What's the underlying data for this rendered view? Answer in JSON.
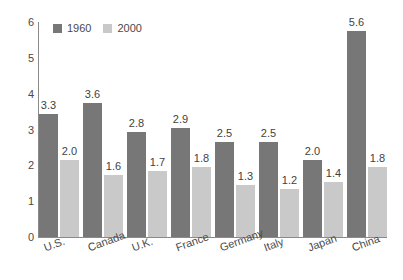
{
  "chart_data": {
    "type": "bar",
    "title": "",
    "subtitle": "",
    "xlabel": "",
    "ylabel": "",
    "categories": [
      "U.S.",
      "Canada",
      "U.K.",
      "France",
      "Germany",
      "Italy",
      "Japan",
      "China"
    ],
    "series": [
      {
        "name": "1960",
        "color": "#777777",
        "values": [
          3.3,
          3.6,
          2.8,
          2.9,
          2.5,
          2.5,
          2.0,
          5.6
        ]
      },
      {
        "name": "2000",
        "color": "#c9c9c9",
        "values": [
          2.0,
          1.6,
          1.7,
          1.8,
          1.3,
          1.2,
          1.4,
          1.8
        ]
      }
    ],
    "data_labels": [
      [
        "3.3",
        "2.0"
      ],
      [
        "3.6",
        "1.6"
      ],
      [
        "2.8",
        "1.7"
      ],
      [
        "2.9",
        "1.8"
      ],
      [
        "2.5",
        "1.3"
      ],
      [
        "2.5",
        "1.2"
      ],
      [
        "2.0",
        "1.4"
      ],
      [
        "5.6",
        "1.8"
      ]
    ],
    "yticks": [
      "6",
      "5",
      "4",
      "3",
      "2",
      "1",
      "0"
    ],
    "ytick_values": [
      6,
      5,
      4,
      3,
      2,
      1,
      0
    ],
    "ylim": [
      0,
      6
    ],
    "grid": false,
    "legend_position": "top-left",
    "legend": [
      "1960",
      "2000"
    ]
  }
}
